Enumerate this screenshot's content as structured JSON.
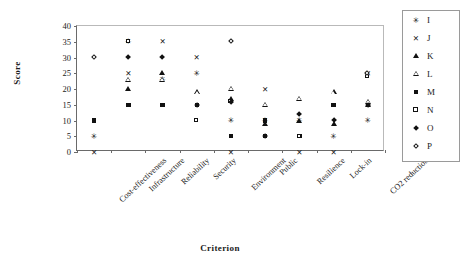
{
  "chart_data": {
    "type": "scatter",
    "title": "",
    "xlabel": "Criterion",
    "ylabel": "Score",
    "ylim": [
      0,
      40
    ],
    "yticks": [
      0,
      5,
      10,
      15,
      20,
      25,
      30,
      35,
      40
    ],
    "grid": false,
    "legend_position": "right",
    "categories": [
      "Cost-effectiveness",
      "Infrastructure",
      "Reliability",
      "Security",
      "Environment",
      "Public",
      "Resilience",
      "Lock-in",
      "CO2 reduction"
    ],
    "series": [
      {
        "name": "I",
        "marker": "asterisk",
        "values": [
          5,
          35,
          23,
          25,
          10,
          10,
          10,
          5,
          10
        ]
      },
      {
        "name": "J",
        "marker": "x",
        "values": [
          0,
          25,
          35,
          30,
          0,
          20,
          0,
          0,
          25
        ]
      },
      {
        "name": "K",
        "marker": "triangle-up",
        "values": [
          null,
          20,
          25,
          null,
          17,
          9,
          10,
          9,
          15
        ]
      },
      {
        "name": "L",
        "marker": "triangle-up-open",
        "values": [
          null,
          23,
          23,
          19,
          20,
          15,
          17,
          19,
          16
        ]
      },
      {
        "name": "M",
        "marker": "square",
        "values": [
          10,
          15,
          15,
          15,
          5,
          10,
          5,
          15,
          15
        ]
      },
      {
        "name": "N",
        "marker": "square-open",
        "values": [
          null,
          35,
          null,
          10,
          16,
          5,
          5,
          null,
          24
        ]
      },
      {
        "name": "O",
        "marker": "diamond",
        "values": [
          null,
          30,
          30,
          15,
          16,
          5,
          12,
          10,
          15
        ]
      },
      {
        "name": "P",
        "marker": "diamond-open",
        "values": [
          30,
          null,
          null,
          null,
          35,
          null,
          null,
          null,
          25
        ]
      }
    ]
  },
  "legend": {
    "entries": [
      {
        "label": "I",
        "marker": "asterisk"
      },
      {
        "label": "J",
        "marker": "x"
      },
      {
        "label": "K",
        "marker": "triangle-up"
      },
      {
        "label": "L",
        "marker": "triangle-up-open"
      },
      {
        "label": "M",
        "marker": "square"
      },
      {
        "label": "N",
        "marker": "square-open"
      },
      {
        "label": "O",
        "marker": "diamond"
      },
      {
        "label": "P",
        "marker": "diamond-open"
      }
    ]
  },
  "axes": {
    "y_title": "Score",
    "x_title": "Criterion"
  }
}
